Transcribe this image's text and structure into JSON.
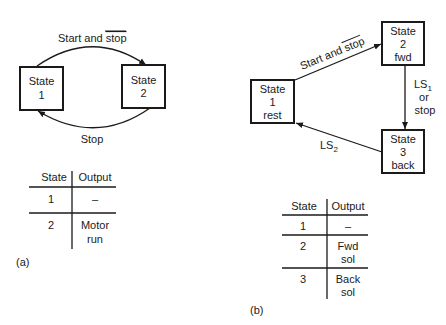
{
  "diagram_a": {
    "caption": "(a)",
    "states": [
      {
        "id": "1",
        "lines": [
          "State",
          "1"
        ]
      },
      {
        "id": "2",
        "lines": [
          "State",
          "2"
        ]
      }
    ],
    "transitions": [
      {
        "from": "1",
        "to": "2",
        "label": "Start and ",
        "label_overline": "stop"
      },
      {
        "from": "2",
        "to": "1",
        "label": "Stop"
      }
    ],
    "table": {
      "headers": [
        "State",
        "Output"
      ],
      "rows": [
        {
          "state": "1",
          "output": [
            "–"
          ]
        },
        {
          "state": "2",
          "output": [
            "Motor",
            "run"
          ]
        }
      ]
    }
  },
  "diagram_b": {
    "caption": "(b)",
    "states": [
      {
        "id": "1",
        "lines": [
          "State",
          "1",
          "rest"
        ]
      },
      {
        "id": "2",
        "lines": [
          "State",
          "2",
          "fwd"
        ]
      },
      {
        "id": "3",
        "lines": [
          "State",
          "3",
          "back"
        ]
      }
    ],
    "transitions": [
      {
        "from": "1",
        "to": "2",
        "label": "Start and ",
        "label_overline": "stop"
      },
      {
        "from": "2",
        "to": "3",
        "label_lines": [
          "LS",
          "or",
          "stop"
        ],
        "label_sub": "1"
      },
      {
        "from": "3",
        "to": "1",
        "label": "LS",
        "label_sub": "2"
      }
    ],
    "table": {
      "headers": [
        "State",
        "Output"
      ],
      "rows": [
        {
          "state": "1",
          "output": [
            "–"
          ]
        },
        {
          "state": "2",
          "output": [
            "Fwd",
            "sol"
          ]
        },
        {
          "state": "3",
          "output": [
            "Back",
            "sol"
          ]
        }
      ]
    }
  }
}
